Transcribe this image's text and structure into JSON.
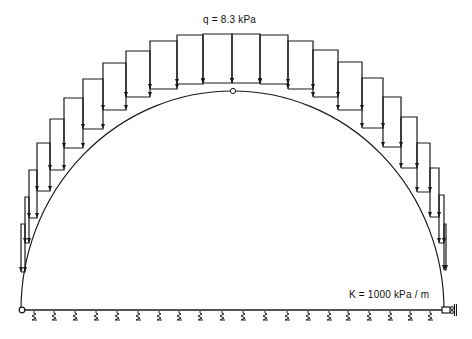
{
  "labels": {
    "load": "q = 8.3 kPa",
    "stiffness": "K = 1000 kPa / m"
  },
  "colors": {
    "line": "#1a1a1a",
    "background": "#ffffff"
  },
  "arch": {
    "left_foot": [
      21,
      310
    ],
    "crown": [
      233,
      91
    ],
    "right_foot": [
      444,
      310
    ],
    "crown_hinge": true
  },
  "base": {
    "y": 310,
    "x_start": 21,
    "x_end": 444,
    "springs_x": [
      34,
      54,
      75,
      96,
      117,
      138,
      159,
      179,
      200,
      222,
      243,
      265,
      287,
      308,
      329,
      348,
      369,
      390,
      410,
      430
    ]
  },
  "supports": {
    "left": "pin",
    "right": "roller"
  },
  "load_panels": [
    {
      "x1": 21,
      "x2": 25,
      "top": 224,
      "bottom": 272
    },
    {
      "x1": 25,
      "x2": 29,
      "top": 197,
      "bottom": 243
    },
    {
      "x1": 29,
      "x2": 37,
      "top": 170,
      "bottom": 218
    },
    {
      "x1": 37,
      "x2": 50,
      "top": 143,
      "bottom": 191
    },
    {
      "x1": 50,
      "x2": 64,
      "top": 119,
      "bottom": 170
    },
    {
      "x1": 64,
      "x2": 83,
      "top": 98,
      "bottom": 148
    },
    {
      "x1": 83,
      "x2": 103,
      "top": 79,
      "bottom": 129
    },
    {
      "x1": 103,
      "x2": 126,
      "top": 63,
      "bottom": 110
    },
    {
      "x1": 126,
      "x2": 150,
      "top": 51,
      "bottom": 97
    },
    {
      "x1": 150,
      "x2": 177,
      "top": 41,
      "bottom": 89
    },
    {
      "x1": 177,
      "x2": 203,
      "top": 35,
      "bottom": 84
    },
    {
      "x1": 203,
      "x2": 232,
      "top": 34,
      "bottom": 83
    },
    {
      "x1": 232,
      "x2": 260,
      "top": 34,
      "bottom": 83
    },
    {
      "x1": 260,
      "x2": 288,
      "top": 35,
      "bottom": 84
    },
    {
      "x1": 288,
      "x2": 313,
      "top": 41,
      "bottom": 89
    },
    {
      "x1": 313,
      "x2": 338,
      "top": 50,
      "bottom": 97
    },
    {
      "x1": 338,
      "x2": 362,
      "top": 62,
      "bottom": 110
    },
    {
      "x1": 362,
      "x2": 383,
      "top": 78,
      "bottom": 128
    },
    {
      "x1": 383,
      "x2": 401,
      "top": 97,
      "bottom": 147
    },
    {
      "x1": 401,
      "x2": 417,
      "top": 117,
      "bottom": 168
    },
    {
      "x1": 417,
      "x2": 430,
      "top": 143,
      "bottom": 192
    },
    {
      "x1": 430,
      "x2": 439,
      "top": 168,
      "bottom": 217
    },
    {
      "x1": 439,
      "x2": 444,
      "top": 195,
      "bottom": 243
    },
    {
      "x1": 444,
      "x2": 446,
      "top": 224,
      "bottom": 270
    }
  ]
}
